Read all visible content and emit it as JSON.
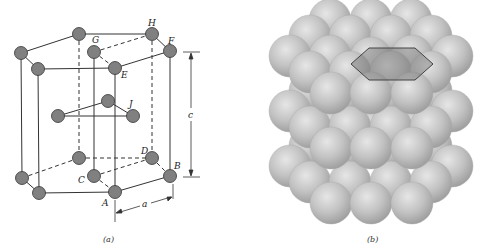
{
  "figure": {
    "panel_a": {
      "caption": "(a)",
      "description": "Hexagonal close-packed unit cell",
      "atom_color": "#808080",
      "atom_stroke": "#333333",
      "atom_radius": 6.5,
      "atoms": [
        {
          "id": "top_back_left",
          "x": 79,
          "y": 34
        },
        {
          "id": "H",
          "x": 152,
          "y": 34
        },
        {
          "id": "top_left",
          "x": 21,
          "y": 53
        },
        {
          "id": "G",
          "x": 94,
          "y": 52
        },
        {
          "id": "F",
          "x": 170,
          "y": 51
        },
        {
          "id": "top_front_left",
          "x": 38,
          "y": 69
        },
        {
          "id": "E",
          "x": 115,
          "y": 68
        },
        {
          "id": "J_back",
          "x": 108,
          "y": 101
        },
        {
          "id": "mid_left",
          "x": 58,
          "y": 116
        },
        {
          "id": "J",
          "x": 133,
          "y": 116
        },
        {
          "id": "bot_back_left",
          "x": 79,
          "y": 158
        },
        {
          "id": "D",
          "x": 152,
          "y": 158
        },
        {
          "id": "bot_left",
          "x": 22,
          "y": 178
        },
        {
          "id": "C",
          "x": 94,
          "y": 176
        },
        {
          "id": "B",
          "x": 170,
          "y": 176
        },
        {
          "id": "bot_front_left",
          "x": 39,
          "y": 193
        },
        {
          "id": "A",
          "x": 115,
          "y": 192
        }
      ],
      "labels": [
        {
          "text": "H",
          "x": 148,
          "y": 24
        },
        {
          "text": "G",
          "x": 93,
          "y": 42
        },
        {
          "text": "F",
          "x": 168,
          "y": 42
        },
        {
          "text": "E",
          "x": 121,
          "y": 77
        },
        {
          "text": "J",
          "x": 129,
          "y": 106
        },
        {
          "text": "D",
          "x": 141,
          "y": 153
        },
        {
          "text": "C",
          "x": 78,
          "y": 182
        },
        {
          "text": "B",
          "x": 174,
          "y": 167
        },
        {
          "text": "A",
          "x": 102,
          "y": 205
        }
      ],
      "dimensions": [
        {
          "name": "c",
          "label": "c"
        },
        {
          "name": "a",
          "label": "a"
        }
      ]
    },
    "panel_b": {
      "caption": "(b)",
      "description": "Stack of close-packed spheres with hexagonal outline on top layer",
      "sphere_color": "#c4c4c4",
      "sphere_radius": 22,
      "hexagon_fill": "#6e6e6e",
      "hexagon_opacity": 0.45
    }
  }
}
